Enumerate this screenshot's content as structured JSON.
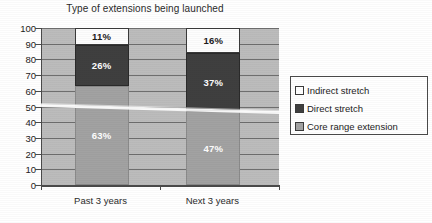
{
  "chart_data": {
    "type": "bar",
    "subtype": "stacked-bar-100",
    "title": "Type of extensions being launched",
    "xlabel": "",
    "ylabel": "",
    "categories": [
      "Past 3 years",
      "Next 3 years"
    ],
    "series": [
      {
        "name": "Core range extension",
        "values": [
          63,
          47
        ],
        "labels": [
          "63%",
          "47%"
        ],
        "color": "#a2a2a2"
      },
      {
        "name": "Direct stretch",
        "values": [
          26,
          37
        ],
        "labels": [
          "26%",
          "37%"
        ],
        "color": "#3f3f3f"
      },
      {
        "name": "Indirect stretch",
        "values": [
          11,
          16
        ],
        "labels": [
          "11%",
          "16%"
        ],
        "color": "#ffffff"
      }
    ],
    "ylim": [
      0,
      100
    ],
    "ytick_labels": [
      "100",
      "90",
      "80",
      "70",
      "60",
      "50",
      "40",
      "30",
      "20",
      "10",
      "0"
    ],
    "ytick_values": [
      100,
      90,
      80,
      70,
      60,
      50,
      40,
      30,
      20,
      10,
      0
    ],
    "grid": true,
    "grid_axis": "y",
    "legend_position": "right",
    "legend_entries": [
      "Indirect stretch",
      "Direct stretch",
      "Core range extension"
    ],
    "plot_background": "#bcbcbc"
  },
  "title": {
    "text": "Type of extensions being launched"
  },
  "yaxis": {
    "ticks": [
      {
        "label": "100",
        "value": 100
      },
      {
        "label": "90",
        "value": 90
      },
      {
        "label": "80",
        "value": 80
      },
      {
        "label": "70",
        "value": 70
      },
      {
        "label": "60",
        "value": 60
      },
      {
        "label": "50",
        "value": 50
      },
      {
        "label": "40",
        "value": 40
      },
      {
        "label": "30",
        "value": 30
      },
      {
        "label": "20",
        "value": 20
      },
      {
        "label": "10",
        "value": 10
      },
      {
        "label": "0",
        "value": 0
      }
    ]
  },
  "xaxis": {
    "categories": [
      {
        "label": "Past 3 years"
      },
      {
        "label": "Next 3 years"
      }
    ]
  },
  "bars": [
    {
      "category": "Past 3 years",
      "segments": [
        {
          "series": "Indirect stretch",
          "value": 11,
          "label": "11%"
        },
        {
          "series": "Direct stretch",
          "value": 26,
          "label": "26%"
        },
        {
          "series": "Core range extension",
          "value": 63,
          "label": "63%"
        }
      ]
    },
    {
      "category": "Next 3 years",
      "segments": [
        {
          "series": "Indirect stretch",
          "value": 16,
          "label": "16%"
        },
        {
          "series": "Direct stretch",
          "value": 37,
          "label": "37%"
        },
        {
          "series": "Core range extension",
          "value": 47,
          "label": "47%"
        }
      ]
    }
  ],
  "legend": {
    "items": [
      {
        "label": "Indirect stretch",
        "color": "#ffffff"
      },
      {
        "label": "Direct stretch",
        "color": "#3f3f3f"
      },
      {
        "label": "Core range extension",
        "color": "#a2a2a2"
      }
    ]
  }
}
